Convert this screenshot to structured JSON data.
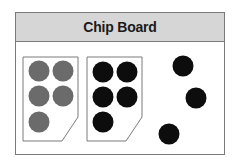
{
  "board": {
    "title": "Chip Board"
  },
  "colors": {
    "header_bg": "#d6d6d6",
    "border": "#7a7a7a",
    "gray_chip": "#6b6b6b",
    "black_chip": "#0d0d0d"
  },
  "groups": [
    {
      "name": "gray-chip-tray",
      "color": "gray",
      "count": 5
    },
    {
      "name": "black-chip-tray",
      "color": "black",
      "count": 5
    },
    {
      "name": "loose-black-chips",
      "color": "black",
      "count": 3
    }
  ]
}
